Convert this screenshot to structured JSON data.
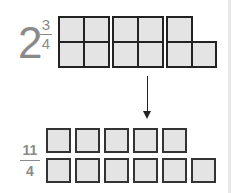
{
  "mixed_number": {
    "whole": "2",
    "numerator": "3",
    "denominator": "4"
  },
  "improper_fraction": {
    "numerator": "11",
    "denominator": "4"
  },
  "top_model": {
    "description": "Two whole squares each split into 4 quarters, plus 3 quarters",
    "groups": [
      {
        "quarters_shaded": 4
      },
      {
        "quarters_shaded": 4
      },
      {
        "quarters_shaded": 3
      }
    ]
  },
  "bottom_model": {
    "description": "11 separate quarter pieces",
    "rows": [
      5,
      6
    ]
  },
  "colors": {
    "cell_fill": "#e4e4e4",
    "cell_border": "#222222",
    "text": "#8a8a8a"
  }
}
